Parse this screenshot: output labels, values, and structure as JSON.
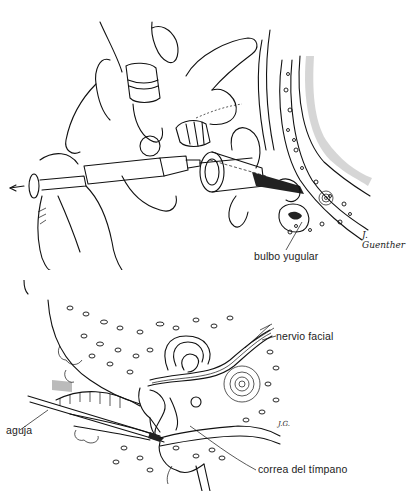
{
  "figure": {
    "top_panel": {
      "description": "Hands aspirating with a syringe and needle through an ear speculum into the middle ear",
      "labels": [
        {
          "id": "bulbo_yugular",
          "text": "bulbo yugular"
        }
      ],
      "signature": "J. Guenther",
      "arrow_direction": "left"
    },
    "bottom_panel": {
      "description": "Cross-section of the temporal bone showing needle passing through the tympanic membrane",
      "labels": [
        {
          "id": "nervio_facial",
          "text": "nervio facial"
        },
        {
          "id": "aguja",
          "text": "aguja"
        },
        {
          "id": "correa_del_timpano",
          "text": "correa del tímpano"
        }
      ],
      "initials": "J.G."
    }
  }
}
